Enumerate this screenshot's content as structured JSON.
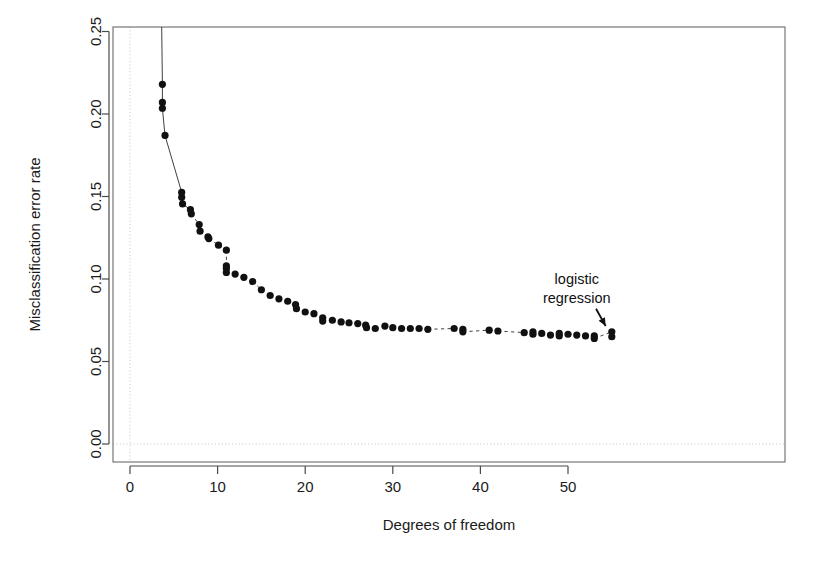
{
  "chart_data": {
    "type": "scatter",
    "title": "",
    "subtitle": "",
    "xlabel": "Degrees of freedom",
    "ylabel": "Misclassification error rate",
    "xlim": [
      -2,
      58
    ],
    "ylim": [
      -0.012,
      0.262
    ],
    "xticks": [
      0,
      10,
      20,
      30,
      40,
      50
    ],
    "xticklabels": [
      "0",
      "10",
      "20",
      "30",
      "40",
      "50"
    ],
    "yticks": [
      0.0,
      0.05,
      0.1,
      0.15,
      0.2,
      0.25
    ],
    "yticklabels": [
      "0.00",
      "0.05",
      "0.10",
      "0.15",
      "0.20",
      "0.25"
    ],
    "grid": "dotted reference lines at x=0 and y=0.00",
    "legend": "none",
    "annotations": [
      {
        "text_lines": [
          "logistic",
          "regression"
        ],
        "text_x": 51.0,
        "text_y": 0.097,
        "arrow_from_x": 53.2,
        "arrow_from_y": 0.082,
        "arrow_to_x": 54.3,
        "arrow_to_y": 0.0715
      }
    ],
    "series": [
      {
        "name": "misclassification error",
        "marker": "filled circle",
        "color": "#111111",
        "connector": "dotted/solid thin line",
        "points": [
          {
            "x": 3.7,
            "y": 0.218
          },
          {
            "x": 3.7,
            "y": 0.207
          },
          {
            "x": 3.7,
            "y": 0.2035
          },
          {
            "x": 4.0,
            "y": 0.187
          },
          {
            "x": 5.9,
            "y": 0.1525
          },
          {
            "x": 5.9,
            "y": 0.1495
          },
          {
            "x": 6.0,
            "y": 0.1455
          },
          {
            "x": 6.9,
            "y": 0.142
          },
          {
            "x": 7.0,
            "y": 0.1395
          },
          {
            "x": 7.9,
            "y": 0.133
          },
          {
            "x": 8.0,
            "y": 0.129
          },
          {
            "x": 8.9,
            "y": 0.1255
          },
          {
            "x": 9.0,
            "y": 0.1245
          },
          {
            "x": 10.1,
            "y": 0.1205
          },
          {
            "x": 11.0,
            "y": 0.1175
          },
          {
            "x": 11.0,
            "y": 0.108
          },
          {
            "x": 11.0,
            "y": 0.1065
          },
          {
            "x": 11.0,
            "y": 0.104
          },
          {
            "x": 12.0,
            "y": 0.103
          },
          {
            "x": 13.0,
            "y": 0.101
          },
          {
            "x": 14.0,
            "y": 0.0985
          },
          {
            "x": 15.0,
            "y": 0.0935
          },
          {
            "x": 16.0,
            "y": 0.09
          },
          {
            "x": 17.0,
            "y": 0.088
          },
          {
            "x": 18.0,
            "y": 0.0865
          },
          {
            "x": 18.9,
            "y": 0.0845
          },
          {
            "x": 19.0,
            "y": 0.082
          },
          {
            "x": 20.0,
            "y": 0.08
          },
          {
            "x": 21.0,
            "y": 0.079
          },
          {
            "x": 22.0,
            "y": 0.0765
          },
          {
            "x": 22.0,
            "y": 0.0745
          },
          {
            "x": 23.1,
            "y": 0.075
          },
          {
            "x": 24.1,
            "y": 0.074
          },
          {
            "x": 25.0,
            "y": 0.0735
          },
          {
            "x": 26.0,
            "y": 0.073
          },
          {
            "x": 26.9,
            "y": 0.072
          },
          {
            "x": 27.0,
            "y": 0.0705
          },
          {
            "x": 28.0,
            "y": 0.07
          },
          {
            "x": 29.1,
            "y": 0.0715
          },
          {
            "x": 30.0,
            "y": 0.0705
          },
          {
            "x": 31.0,
            "y": 0.07
          },
          {
            "x": 32.0,
            "y": 0.07
          },
          {
            "x": 33.0,
            "y": 0.07
          },
          {
            "x": 34.0,
            "y": 0.0695
          },
          {
            "x": 37.0,
            "y": 0.07
          },
          {
            "x": 38.0,
            "y": 0.0695
          },
          {
            "x": 38.0,
            "y": 0.068
          },
          {
            "x": 41.0,
            "y": 0.069
          },
          {
            "x": 42.0,
            "y": 0.0685
          },
          {
            "x": 45.0,
            "y": 0.0675
          },
          {
            "x": 46.0,
            "y": 0.068
          },
          {
            "x": 46.0,
            "y": 0.0665
          },
          {
            "x": 47.0,
            "y": 0.067
          },
          {
            "x": 48.0,
            "y": 0.066
          },
          {
            "x": 49.0,
            "y": 0.067
          },
          {
            "x": 49.0,
            "y": 0.0655
          },
          {
            "x": 50.0,
            "y": 0.0665
          },
          {
            "x": 51.0,
            "y": 0.066
          },
          {
            "x": 52.0,
            "y": 0.0655
          },
          {
            "x": 53.0,
            "y": 0.0655
          },
          {
            "x": 53.0,
            "y": 0.064
          },
          {
            "x": 55.0,
            "y": 0.068
          },
          {
            "x": 55.0,
            "y": 0.065
          }
        ]
      }
    ]
  }
}
